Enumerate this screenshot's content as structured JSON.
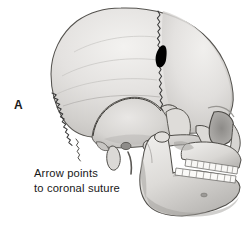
{
  "figure": {
    "panel_label": "A",
    "caption_line_1": "Arrow points",
    "caption_line_2": "to coronal suture",
    "illustration_style": "grayscale-anatomical-drawing",
    "background_color": "#ffffff"
  },
  "annotation": {
    "marker": "arrowhead-marker",
    "marker_color": "#000000",
    "marker_points_to": "coronal-suture",
    "marker_position": {
      "x": 160,
      "y": 57
    }
  },
  "anatomy": {
    "regions": [
      {
        "name": "frontal-bone",
        "label": "Frontal bone"
      },
      {
        "name": "parietal-bone",
        "label": "Parietal bone"
      },
      {
        "name": "occipital-bone",
        "label": "Occipital bone"
      },
      {
        "name": "temporal-bone",
        "label": "Temporal bone"
      },
      {
        "name": "sphenoid-bone",
        "label": "Sphenoid bone"
      },
      {
        "name": "zygomatic-arch",
        "label": "Zygomatic arch"
      },
      {
        "name": "maxilla",
        "label": "Maxilla"
      },
      {
        "name": "mandible",
        "label": "Mandible"
      },
      {
        "name": "nasal-bone",
        "label": "Nasal bone"
      },
      {
        "name": "orbit",
        "label": "Orbit"
      },
      {
        "name": "mastoid-process",
        "label": "Mastoid process"
      },
      {
        "name": "styloid-process",
        "label": "Styloid process"
      }
    ],
    "sutures": [
      {
        "name": "coronal-suture",
        "label": "Coronal suture"
      },
      {
        "name": "lambdoid-suture",
        "label": "Lambdoid suture"
      },
      {
        "name": "squamosal-suture",
        "label": "Squamosal suture"
      }
    ],
    "teeth": {
      "upper_row_count": 8,
      "lower_row_count": 8,
      "tooth_color": "#fdfdfd"
    }
  },
  "palette": {
    "bone_light": "#ecebe9",
    "bone_mid": "#d8d6d3",
    "bone_shadow": "#b9b7b4",
    "bone_deep_shadow": "#9b9996",
    "outline": "#4a4a4a",
    "suture_line": "#3a3a3a",
    "marker": "#000000",
    "text": "#181818"
  }
}
